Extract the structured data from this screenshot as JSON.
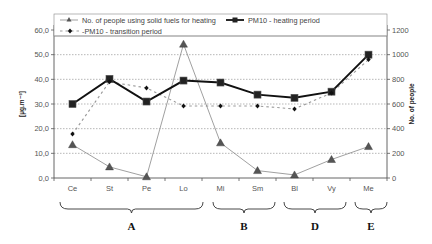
{
  "chart_data": {
    "type": "line",
    "title": "",
    "categories": [
      "Ce",
      "St",
      "Pe",
      "Lo",
      "Mi",
      "Sm",
      "Bl",
      "Vy",
      "Me"
    ],
    "groups": [
      {
        "label": "A",
        "categories": [
          "Ce",
          "St",
          "Pe",
          "Lo"
        ]
      },
      {
        "label": "B",
        "categories": [
          "Mi",
          "Sm"
        ]
      },
      {
        "label": "D",
        "categories": [
          "Bl",
          "Vy"
        ]
      },
      {
        "label": "E",
        "categories": [
          "Me"
        ]
      }
    ],
    "ylabel": "[µg.m⁻³]",
    "ylim": [
      0,
      60
    ],
    "yticks": [
      "0,0",
      "10,0",
      "20,0",
      "30,0",
      "40,0",
      "50,0",
      "60,0"
    ],
    "y2label": "No. of people",
    "y2lim": [
      0,
      1200
    ],
    "y2ticks": [
      "0",
      "200",
      "400",
      "600",
      "800",
      "1000",
      "1200"
    ],
    "grid": true,
    "legend_position": "top",
    "series": [
      {
        "name": "No. of people using solid fuels for heating",
        "axis": "right",
        "style": "thin-gray-line-triangle",
        "values": [
          270,
          90,
          10,
          1085,
          285,
          60,
          25,
          150,
          255
        ]
      },
      {
        "name": "PM10 - heating period",
        "axis": "left",
        "style": "thick-black-line-square",
        "values": [
          30.0,
          40.2,
          31.0,
          39.5,
          38.7,
          33.8,
          32.5,
          35.0,
          50.0
        ]
      },
      {
        "name": "PM10 - transition period",
        "axis": "left",
        "style": "dashed-gray-line-diamond",
        "values": [
          17.8,
          39.0,
          36.5,
          29.2,
          29.2,
          29.2,
          28.0,
          34.5,
          48.0
        ]
      }
    ]
  }
}
